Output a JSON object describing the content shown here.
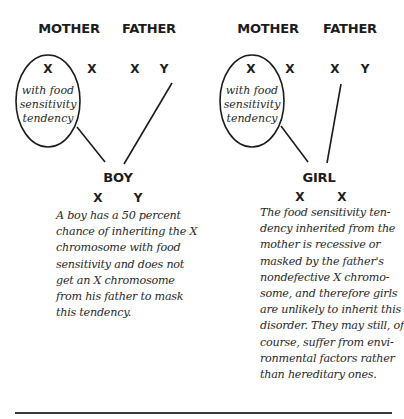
{
  "left_panel": {
    "mother_label": "MOTHER",
    "father_label": "FATHER",
    "mother_chromosomes": [
      "X",
      "X"
    ],
    "father_chromosomes": [
      "X",
      "Y"
    ],
    "ellipse_text": [
      "with food",
      "sensitivity",
      "tendency"
    ],
    "child_label": "BOY",
    "child_chromosomes": [
      "X",
      "Y"
    ],
    "description_lines": [
      "A boy has a 50 percent",
      "chance of inheriting the X",
      "chromosome with food",
      "sensitivity and does not",
      "get an X chromosome",
      "from his father to mask",
      "this tendency."
    ]
  },
  "right_panel": {
    "mother_label": "MOTHER",
    "father_label": "FATHER",
    "mother_chromosomes": [
      "X",
      "X"
    ],
    "father_chromosomes": [
      "X",
      "Y"
    ],
    "ellipse_text": [
      "with food",
      "sensitivity",
      "tendency"
    ],
    "child_label": "GIRL",
    "child_chromosomes": [
      "X",
      "X"
    ],
    "description_lines": [
      "The food sensitivity ten-",
      "dency inherited from the",
      "mother is recessive or",
      "masked by the father's",
      "nondefective X chromo-",
      "some, and therefore girls",
      "are unlikely to inherit this",
      "disorder. They may still, of",
      "course, suffer from envi-",
      "ronmental factors rather",
      "than hereditary ones."
    ]
  },
  "colors": {
    "ink": "#1c1c1c",
    "text": "#2a2a2a",
    "rule": "#3a3a3a",
    "background": "#ffffff"
  }
}
